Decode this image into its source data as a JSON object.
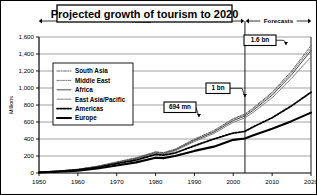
{
  "title": "Projected growth of tourism to 2020",
  "bands": [
    {
      "label": "Actual"
    },
    {
      "label": "Forecasts"
    }
  ],
  "chart_data": {
    "type": "line",
    "title": "Projected growth of tourism to 2020",
    "xlabel": "",
    "ylabel": "Millions",
    "xlim": [
      1950,
      2020
    ],
    "ylim": [
      0,
      1600
    ],
    "grid": true,
    "legend_position": "inside-left",
    "xticks": [
      "1950",
      "1960",
      "1970",
      "1980",
      "1990",
      "2000",
      "2010",
      "2020"
    ],
    "yticks": [
      "0",
      "200",
      "400",
      "600",
      "800",
      "1,000",
      "1,200",
      "1,400",
      "1,600"
    ],
    "x": [
      1950,
      1955,
      1960,
      1965,
      1970,
      1975,
      1980,
      1982,
      1985,
      1990,
      1995,
      2000,
      2003,
      2005,
      2010,
      2015,
      2020
    ],
    "series": [
      {
        "name": "South Asia",
        "style": "dash-dot",
        "values": [
          12,
          25,
          45,
          80,
          130,
          180,
          250,
          240,
          280,
          400,
          500,
          640,
          694,
          760,
          950,
          1200,
          1500
        ]
      },
      {
        "name": "Middle East",
        "style": "dash-dot-light",
        "values": [
          11,
          24,
          43,
          78,
          127,
          176,
          245,
          236,
          275,
          393,
          492,
          631,
          685,
          750,
          935,
          1180,
          1470
        ]
      },
      {
        "name": "Africa",
        "style": "solid-thin",
        "values": [
          10,
          22,
          41,
          75,
          123,
          171,
          238,
          230,
          268,
          383,
          480,
          617,
          670,
          733,
          915,
          1155,
          1440
        ]
      },
      {
        "name": "East Asia/Pacific",
        "style": "solid-thin",
        "values": [
          9,
          21,
          39,
          72,
          119,
          165,
          230,
          222,
          259,
          370,
          464,
          597,
          648,
          710,
          885,
          1115,
          1365
        ]
      },
      {
        "name": "Americas",
        "style": "dotted-bold",
        "values": [
          8,
          19,
          36,
          67,
          110,
          152,
          218,
          210,
          235,
          320,
          400,
          470,
          490,
          540,
          650,
          790,
          950
        ]
      },
      {
        "name": "Europe",
        "style": "solid-bold",
        "values": [
          6,
          14,
          28,
          52,
          88,
          125,
          180,
          175,
          200,
          260,
          310,
          390,
          405,
          440,
          520,
          610,
          710
        ]
      }
    ],
    "annotations": [
      {
        "label": "694 mn",
        "x": 2003,
        "y": 694
      },
      {
        "label": "1 bn",
        "x": 2010,
        "y": 1000
      },
      {
        "label": "1.6 bn",
        "x": 2020,
        "y": 1600
      }
    ],
    "divider_year": 2003
  },
  "colors": {
    "frame": "#000000",
    "grid": "#8a8a8a",
    "text": "#000000",
    "background": "#ffffff"
  }
}
